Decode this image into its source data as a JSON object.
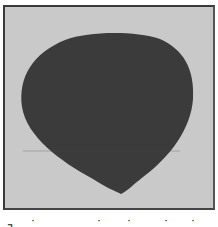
{
  "image": {
    "description": "Photograph of a dark, rounded teardrop/heart-shaped flat object on a light gray background inside a thin dark frame",
    "colors": {
      "background": "#c9c9c9",
      "object": "#3a3a3a",
      "frame": "#3a3a3a",
      "page": "#ffffff"
    }
  },
  "caption": {
    "fragments": [
      "┐",
      "˙",
      "˙",
      "˙",
      "˙",
      "˙"
    ]
  }
}
